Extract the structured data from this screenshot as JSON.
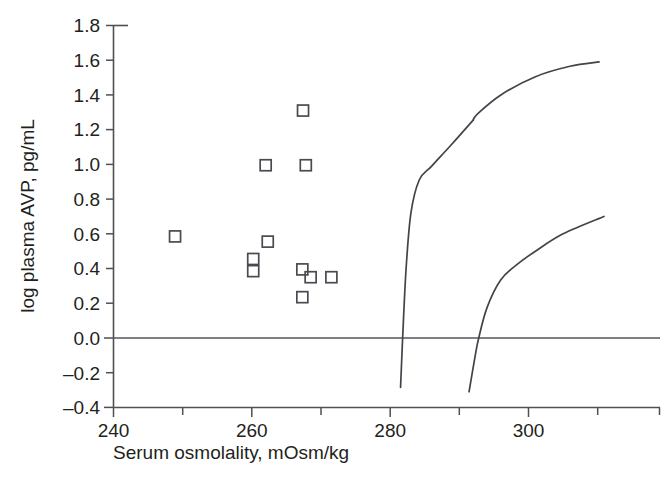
{
  "chart_data": {
    "type": "scatter",
    "title": "",
    "subtitle": "",
    "xlabel": "Serum osmolality, mOsm/kg",
    "ylabel": "log plasma AVP, pg/mL",
    "xlim": [
      240,
      311
    ],
    "ylim": [
      -0.4,
      1.8
    ],
    "grid": false,
    "legend": "none",
    "x_ticks_major": [
      240,
      260,
      280,
      300
    ],
    "x_ticks_minor": [
      250,
      270,
      290,
      310
    ],
    "x_tick_labels": [
      "240",
      "260",
      "280",
      "300"
    ],
    "y_ticks": [
      -0.4,
      -0.2,
      0.0,
      0.2,
      0.4,
      0.6,
      0.8,
      1.0,
      1.2,
      1.4,
      1.6,
      1.8
    ],
    "y_tick_labels": [
      "1.8",
      "1.6",
      "1.4",
      "1.2",
      "1.0",
      "0.8",
      "0.6",
      "0.4",
      "0.2",
      "0.0",
      "–0.2",
      "–0.4"
    ],
    "marker_style": "open-square",
    "marker_color": "#4a4a52",
    "reference_line": {
      "y": 0.0,
      "color": "#55555c"
    },
    "series": [
      {
        "name": "patients",
        "type": "scatter",
        "points": [
          {
            "x": 248.9,
            "y": 0.585
          },
          {
            "x": 262.0,
            "y": 0.995
          },
          {
            "x": 260.2,
            "y": 0.455
          },
          {
            "x": 260.2,
            "y": 0.385
          },
          {
            "x": 262.3,
            "y": 0.555
          },
          {
            "x": 267.4,
            "y": 1.31
          },
          {
            "x": 267.8,
            "y": 0.995
          },
          {
            "x": 267.3,
            "y": 0.395
          },
          {
            "x": 268.5,
            "y": 0.35
          },
          {
            "x": 267.3,
            "y": 0.235
          },
          {
            "x": 271.5,
            "y": 0.35
          }
        ]
      },
      {
        "name": "reference-curve-upper",
        "type": "line",
        "note": "steep left curve; drawn with a small break near x=292",
        "points": [
          {
            "x": 281.5,
            "y": -0.285
          },
          {
            "x": 281.8,
            "y": 0.0
          },
          {
            "x": 282.3,
            "y": 0.4
          },
          {
            "x": 283.0,
            "y": 0.72
          },
          {
            "x": 284.2,
            "y": 0.91
          },
          {
            "x": 286.0,
            "y": 0.99
          },
          {
            "x": 289.0,
            "y": 1.12
          },
          {
            "x": 292.0,
            "y": 1.255
          },
          {
            "x": 292.6,
            "y": 1.29
          },
          {
            "x": 296.0,
            "y": 1.4
          },
          {
            "x": 301.0,
            "y": 1.505
          },
          {
            "x": 306.0,
            "y": 1.565
          },
          {
            "x": 310.2,
            "y": 1.59
          }
        ],
        "break_at_x": 292.2
      },
      {
        "name": "reference-curve-lower",
        "type": "line",
        "points": [
          {
            "x": 291.4,
            "y": -0.31
          },
          {
            "x": 292.3,
            "y": -0.1
          },
          {
            "x": 292.8,
            "y": 0.0
          },
          {
            "x": 294.0,
            "y": 0.175
          },
          {
            "x": 296.0,
            "y": 0.335
          },
          {
            "x": 298.4,
            "y": 0.425
          },
          {
            "x": 301.0,
            "y": 0.5
          },
          {
            "x": 305.0,
            "y": 0.6
          },
          {
            "x": 310.9,
            "y": 0.7
          }
        ]
      }
    ]
  }
}
